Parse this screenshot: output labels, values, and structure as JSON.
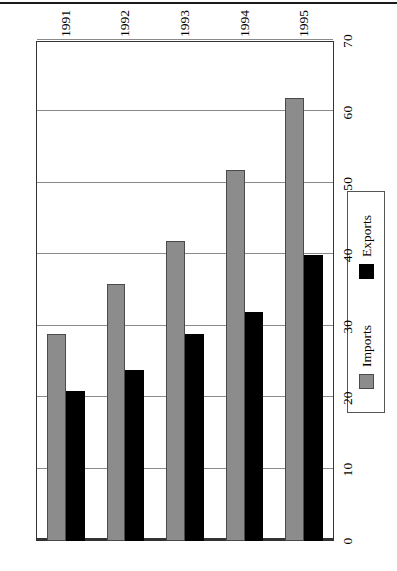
{
  "page": {
    "rule_color": "#1a1a1a"
  },
  "chart_data": {
    "type": "bar",
    "orientation": "horizontal-rotated",
    "title": "",
    "subtitle": "",
    "xlabel": "",
    "ylabel": "",
    "categories": [
      "1991",
      "1992",
      "1993",
      "1994",
      "1995"
    ],
    "series": [
      {
        "name": "Imports",
        "color": "#8c8c8c",
        "values": [
          29,
          36,
          42,
          52,
          62
        ]
      },
      {
        "name": "Exports",
        "color": "#000000",
        "values": [
          21,
          24,
          29,
          32,
          40
        ]
      }
    ],
    "value_axis": {
      "min": 0,
      "max": 70,
      "ticks": [
        0,
        10,
        20,
        30,
        40,
        50,
        60,
        70
      ],
      "tick_labels": [
        "0",
        "10",
        "20",
        "30",
        "40",
        "50",
        "60",
        "70"
      ]
    },
    "grid": true,
    "legend": {
      "position": "bottom",
      "entries": [
        {
          "label": "Imports",
          "color": "#8c8c8c"
        },
        {
          "label": "Exports",
          "color": "#000000"
        }
      ]
    }
  }
}
